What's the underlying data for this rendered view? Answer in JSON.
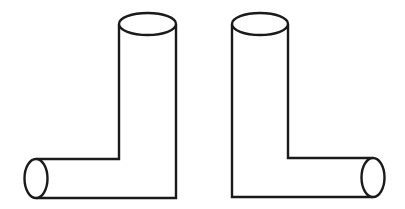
{
  "figure": {
    "stroke_color": "#1a1a1a",
    "fill_color": "#ffffff",
    "background": "#ffffff",
    "pipes": [
      {
        "name": "left-pipe",
        "orientation": "elbow opening to the left",
        "vertical": {
          "left_x": 119,
          "right_x": 176,
          "top_y": 24,
          "bottom_y": 198
        },
        "top_ellipse": {
          "cx": 147.5,
          "cy": 24,
          "rx": 28.5,
          "ry": 11
        },
        "horizontal": {
          "top_y": 159,
          "bottom_y": 198,
          "end_x": 37
        },
        "end_ellipse": {
          "cx": 36,
          "cy": 178.5,
          "rx": 11.5,
          "ry": 19.5
        }
      },
      {
        "name": "right-pipe",
        "orientation": "elbow opening to the right",
        "vertical": {
          "left_x": 232,
          "right_x": 288,
          "top_y": 24,
          "bottom_y": 197
        },
        "top_ellipse": {
          "cx": 260,
          "cy": 24,
          "rx": 28,
          "ry": 11
        },
        "horizontal": {
          "top_y": 158,
          "bottom_y": 197,
          "end_x": 373
        },
        "end_ellipse": {
          "cx": 373,
          "cy": 177.5,
          "rx": 11.5,
          "ry": 19.5
        }
      }
    ]
  }
}
